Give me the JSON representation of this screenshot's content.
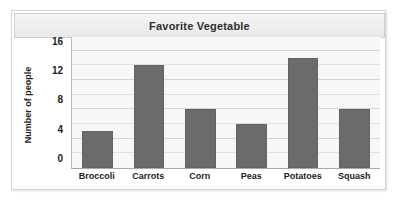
{
  "chart_data": {
    "type": "bar",
    "title": "Favorite Vegetable",
    "xlabel": "",
    "ylabel": "Number of people",
    "categories": [
      "Broccoli",
      "Carrots",
      "Corn",
      "Peas",
      "Potatoes",
      "Squash"
    ],
    "values": [
      5,
      14,
      8,
      6,
      15,
      8
    ],
    "ylim": [
      0,
      18
    ],
    "ytick_labels": [
      "0",
      "4",
      "8",
      "12",
      "16"
    ],
    "ytick_values": [
      0,
      4,
      8,
      12,
      16
    ],
    "gridline_values": [
      2,
      4,
      6,
      8,
      10,
      12,
      14,
      16,
      18
    ],
    "grid": true,
    "legend": "none",
    "bar_color": "#6b6b6b",
    "plot_background": "#f7f7f7",
    "title_background": "#efefef"
  }
}
